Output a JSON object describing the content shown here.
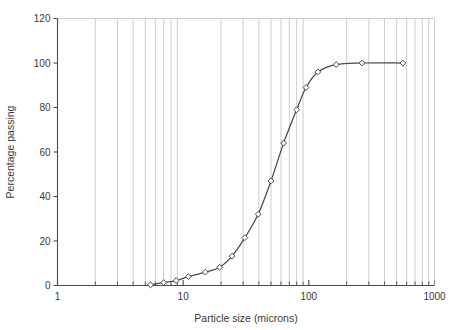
{
  "chart_data": {
    "type": "line",
    "title": "",
    "xlabel": "Particle size (microns)",
    "ylabel": "Percentage passing",
    "xscale": "log",
    "yscale": "linear",
    "xlim": [
      1,
      1000
    ],
    "ylim": [
      0,
      120
    ],
    "yticks": [
      0,
      20,
      40,
      60,
      80,
      100,
      120
    ],
    "xticks": [
      1,
      10,
      100,
      1000
    ],
    "xtick_labels": [
      "1",
      "10",
      "100",
      "1000"
    ],
    "ytick_labels": [
      "0",
      "20",
      "40",
      "60",
      "80",
      "100",
      "120"
    ],
    "grid": "vertical-log-minor",
    "legend": "none",
    "marker": "open-diamond",
    "series": [
      {
        "name": "Cumulative passing",
        "x": [
          5.5,
          7.0,
          8.8,
          11.0,
          15.0,
          19.5,
          24.5,
          31.0,
          39.5,
          50.0,
          63.0,
          80.0,
          95.0,
          118.0,
          165.0,
          265.0,
          560.0
        ],
        "y": [
          0.3,
          1.3,
          2.2,
          4.0,
          6.0,
          8.2,
          13.2,
          21.5,
          32.0,
          47.0,
          64.0,
          79.0,
          89.0,
          96.0,
          99.3,
          100.0,
          100.0
        ]
      }
    ]
  },
  "chart_meta": {
    "line_color": "#4a4a4a",
    "marker_fill": "#ffffff",
    "marker_stroke": "#4a4a4a",
    "grid_color": "#b9b9b9",
    "axis_color": "#4a4a4a",
    "background": "#ffffff"
  }
}
